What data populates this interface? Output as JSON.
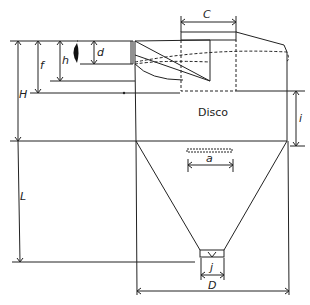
{
  "diagram": {
    "title_label": "Disco",
    "dimensions": {
      "C": "C",
      "d": "d",
      "h": "h",
      "f": "f",
      "H": "H",
      "i": "i",
      "a": "a",
      "L": "L",
      "j": "j",
      "D": "D"
    }
  }
}
